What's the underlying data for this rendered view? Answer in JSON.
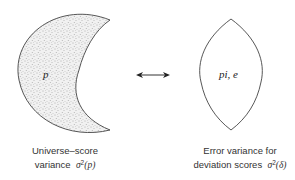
{
  "left_shape": {
    "type": "crescent",
    "fill": "stippled",
    "inner_label": "p",
    "caption_line1": "Universe–score",
    "caption_line2_prefix": "variance",
    "caption_symbol": "σ",
    "caption_sup": "2",
    "caption_arg": "(p)"
  },
  "connector": {
    "type": "double-headed-arrow"
  },
  "right_shape": {
    "type": "lens",
    "fill": "none",
    "inner_label": "pi, e",
    "caption_line1": "Error variance for",
    "caption_line2_prefix": "deviation scores",
    "caption_symbol": "σ",
    "caption_sup": "2",
    "caption_arg": "(δ)"
  },
  "colors": {
    "stroke": "#444444",
    "stipple": "#6a6a6a",
    "background": "#ffffff"
  }
}
